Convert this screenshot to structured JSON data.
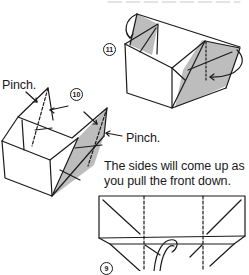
{
  "page": {
    "top_caption_partial": "Pull up and ... position.",
    "steps": [
      {
        "number": "11",
        "label": "Step 11"
      },
      {
        "number": "10",
        "label": "Step 10"
      },
      {
        "number": "9",
        "label": "Step 9"
      }
    ],
    "annotations": {
      "pinch_left": "Pinch.",
      "pinch_right": "Pinch.",
      "instruction_line1": "The sides will come up as",
      "instruction_line2": "you pull the front down."
    },
    "colors": {
      "ink": "#1a1a1a",
      "shade": "#bdbdbd",
      "paper": "#ffffff"
    }
  }
}
